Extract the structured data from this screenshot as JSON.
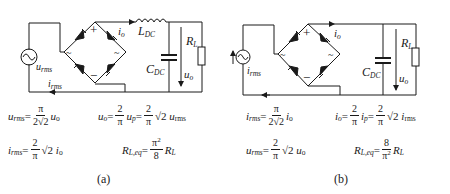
{
  "figure": {
    "panels": [
      {
        "id": "a",
        "caption": "(a)",
        "labels": {
          "source": "u",
          "source_sub": "rms",
          "line_current": "i",
          "line_current_sub": "rms",
          "output_current": "i",
          "output_current_sub": "o",
          "inductor": "L",
          "inductor_sub": "DC",
          "capacitor": "C",
          "capacitor_sub": "DC",
          "load": "R",
          "load_sub": "L",
          "output_voltage": "u",
          "output_voltage_sub": "o",
          "bridge_plus": "+",
          "bridge_minus": "−",
          "bridge_ac": "~"
        },
        "equations": [
          "u_rms = π / (2√2) · u_o",
          "u_o = 2/π · u_p = 2/π · √2 · u_rms",
          "i_rms = 2/π · √2 · i_o",
          "R_L,eq = π² / 8 · R_L"
        ]
      },
      {
        "id": "b",
        "caption": "(b)",
        "labels": {
          "source": "i",
          "source_sub": "rms",
          "output_current": "i",
          "output_current_sub": "o",
          "capacitor": "C",
          "capacitor_sub": "DC",
          "load": "R",
          "load_sub": "L",
          "output_voltage": "u",
          "output_voltage_sub": "o",
          "bridge_plus": "+",
          "bridge_minus": "−",
          "bridge_ac": "~"
        },
        "equations": [
          "i_rms = π / (2√2) · i_o",
          "i_o = 2/π · i_p = 2/π · √2 · i_rms",
          "u_rms = 2/π · √2 · u_o",
          "R_L,eq = 8 / π² · R_L"
        ]
      }
    ],
    "symbols": {
      "pi": "π",
      "two": "2",
      "eight": "8",
      "sqrt2": "√2",
      "two_sqrt2": "2√2",
      "pi_sq": "π",
      "sq": "2",
      "eq": "="
    }
  }
}
